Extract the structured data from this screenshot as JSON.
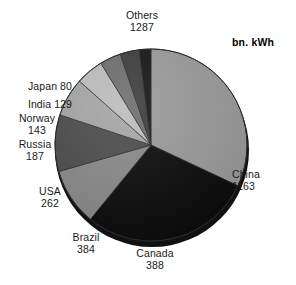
{
  "unit_label": "bn. kWh",
  "chart_data": {
    "type": "pie",
    "title": "",
    "unit": "bn. kWh",
    "total": 4023,
    "legend_position": "labels-around-slices",
    "grid": false,
    "start_angle_deg": 0,
    "direction": "clockwise",
    "categories": [
      "Others",
      "China",
      "Canada",
      "Brazil",
      "USA",
      "Russia",
      "Norway",
      "India",
      "Japan"
    ],
    "values": [
      1287,
      1163,
      388,
      384,
      262,
      187,
      143,
      129,
      80
    ],
    "slices": [
      {
        "name": "Others",
        "value": 1287,
        "label_line1": "Others",
        "label_line2": "1287",
        "color": "#9b9b9b"
      },
      {
        "name": "China",
        "value": 1163,
        "label_line1": "China",
        "label_line2": "1163",
        "color": "#0b0b0b"
      },
      {
        "name": "Canada",
        "value": 388,
        "label_line1": "Canada",
        "label_line2": "388",
        "color": "#8a8a8a"
      },
      {
        "name": "Brazil",
        "value": 384,
        "label_line1": "Brazil",
        "label_line2": "384",
        "color": "#4c4c4c"
      },
      {
        "name": "USA",
        "value": 262,
        "label_line1": "USA",
        "label_line2": "262",
        "color": "#a6a6a6"
      },
      {
        "name": "Russia",
        "value": 187,
        "label_line1": "Russia",
        "label_line2": "187",
        "color": "#bdbdbd"
      },
      {
        "name": "Norway",
        "value": 143,
        "label_line1": "Norway",
        "label_line2": "143",
        "color": "#6e6e6e"
      },
      {
        "name": "India",
        "value": 129,
        "label_line1": "India 129",
        "label_line2": "",
        "color": "#3c3c3c"
      },
      {
        "name": "Japan",
        "value": 80,
        "label_line1": "Japan 80",
        "label_line2": "",
        "color": "#141414"
      }
    ]
  }
}
